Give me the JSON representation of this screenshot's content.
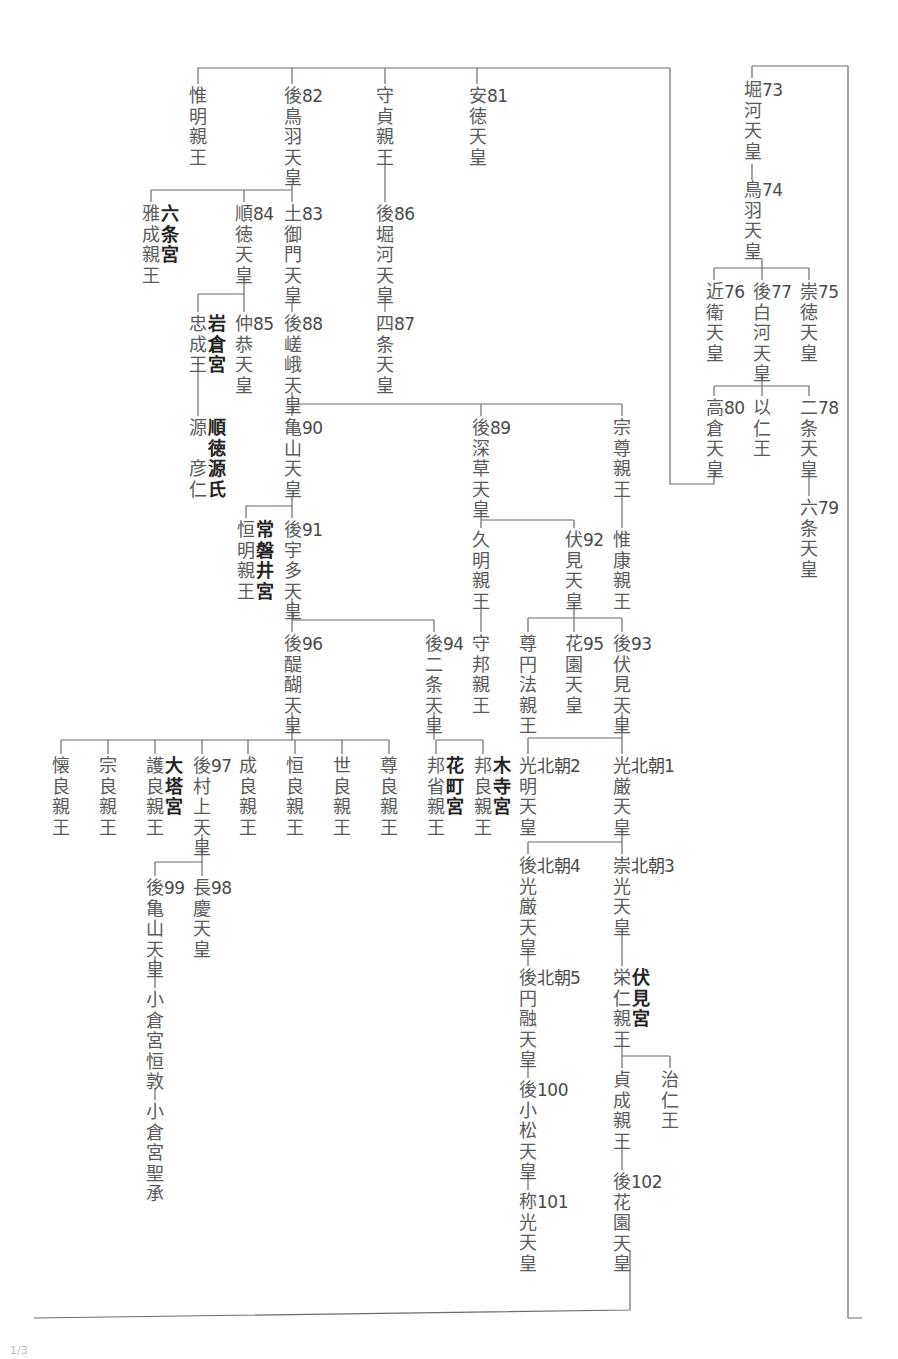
{
  "page_number": "1/3",
  "nodes": [
    {
      "id": "horikawa",
      "name": "堀河天皇",
      "num": "73",
      "x": 743,
      "y": 80
    },
    {
      "id": "toba",
      "name": "鳥羽天皇",
      "num": "74",
      "x": 743,
      "y": 180
    },
    {
      "id": "konoe",
      "name": "近衛天皇",
      "num": "76",
      "x": 705,
      "y": 282
    },
    {
      "id": "goshirakawa",
      "name": "後白河天皇",
      "num": "77",
      "x": 752,
      "y": 282
    },
    {
      "id": "sutoku",
      "name": "崇徳天皇",
      "num": "75",
      "x": 799,
      "y": 282
    },
    {
      "id": "takakura",
      "name": "高倉天皇",
      "num": "80",
      "x": 705,
      "y": 398
    },
    {
      "id": "mochihito",
      "name": "以仁王",
      "num": "",
      "x": 752,
      "y": 398
    },
    {
      "id": "nijo",
      "name": "二条天皇",
      "num": "78",
      "x": 799,
      "y": 398
    },
    {
      "id": "rokujo",
      "name": "六条天皇",
      "num": "79",
      "x": 799,
      "y": 498
    },
    {
      "id": "koremei",
      "name": "惟明親王",
      "num": "",
      "x": 188,
      "y": 86
    },
    {
      "id": "gotoba",
      "name": "後鳥羽天皇",
      "num": "82",
      "x": 283,
      "y": 86
    },
    {
      "id": "morisada",
      "name": "守貞親王",
      "num": "",
      "x": 375,
      "y": 86
    },
    {
      "id": "antoku",
      "name": "安徳天皇",
      "num": "81",
      "x": 468,
      "y": 86
    },
    {
      "id": "gohorikawa",
      "name": "後堀河天皇",
      "num": "86",
      "x": 375,
      "y": 204
    },
    {
      "id": "shijo",
      "name": "四条天皇",
      "num": "87",
      "x": 375,
      "y": 314
    },
    {
      "id": "masanari",
      "name": "雅成親王",
      "num": "",
      "x": 141,
      "y": 204,
      "house": "六条宮"
    },
    {
      "id": "juntoku",
      "name": "順徳天皇",
      "num": "84",
      "x": 234,
      "y": 204
    },
    {
      "id": "tsuchimikado",
      "name": "土御門天皇",
      "num": "83",
      "x": 283,
      "y": 204
    },
    {
      "id": "tadanari",
      "name": "忠成王",
      "num": "",
      "x": 188,
      "y": 314,
      "house": "岩倉宮"
    },
    {
      "id": "chukyo",
      "name": "仲恭天皇",
      "num": "85",
      "x": 234,
      "y": 314
    },
    {
      "id": "gosaga",
      "name": "後嵯峨天皇",
      "num": "88",
      "x": 283,
      "y": 314
    },
    {
      "id": "minamoto",
      "name": "源彦仁",
      "num": "",
      "x": 188,
      "y": 418,
      "house": "順徳源氏",
      "special": true
    },
    {
      "id": "kameyama",
      "name": "亀山天皇",
      "num": "90",
      "x": 283,
      "y": 418
    },
    {
      "id": "gofukakusa",
      "name": "後深草天皇",
      "num": "89",
      "x": 471,
      "y": 418
    },
    {
      "id": "munetaka",
      "name": "宗尊親王",
      "num": "",
      "x": 612,
      "y": 418
    },
    {
      "id": "tsuneaki",
      "name": "恒明親王",
      "num": "",
      "x": 236,
      "y": 520,
      "house": "常磐井宮"
    },
    {
      "id": "gouda",
      "name": "後宇多天皇",
      "num": "91",
      "x": 283,
      "y": 520
    },
    {
      "id": "hisaaki",
      "name": "久明親王",
      "num": "",
      "x": 471,
      "y": 530
    },
    {
      "id": "fushimi",
      "name": "伏見天皇",
      "num": "92",
      "x": 564,
      "y": 530
    },
    {
      "id": "koreyasu",
      "name": "惟康親王",
      "num": "",
      "x": 612,
      "y": 530
    },
    {
      "id": "godaigo",
      "name": "後醍醐天皇",
      "num": "96",
      "x": 283,
      "y": 634
    },
    {
      "id": "gonijo",
      "name": "後二条天皇",
      "num": "94",
      "x": 424,
      "y": 634
    },
    {
      "id": "morikuni",
      "name": "守邦親王",
      "num": "",
      "x": 471,
      "y": 634
    },
    {
      "id": "sonen",
      "name": "尊円法親王",
      "num": "",
      "x": 518,
      "y": 634
    },
    {
      "id": "hanazono",
      "name": "花園天皇",
      "num": "95",
      "x": 564,
      "y": 634
    },
    {
      "id": "gofushimi",
      "name": "後伏見天皇",
      "num": "93",
      "x": 612,
      "y": 634
    },
    {
      "id": "kaneyoshi",
      "name": "懐良親王",
      "num": "",
      "x": 51,
      "y": 756
    },
    {
      "id": "muneyoshi",
      "name": "宗良親王",
      "num": "",
      "x": 98,
      "y": 756
    },
    {
      "id": "moriyoshi",
      "name": "護良親王",
      "num": "",
      "x": 145,
      "y": 756,
      "house": "大塔宮"
    },
    {
      "id": "gomurakami",
      "name": "後村上天皇",
      "num": "97",
      "x": 192,
      "y": 756
    },
    {
      "id": "nariyoshi",
      "name": "成良親王",
      "num": "",
      "x": 238,
      "y": 756
    },
    {
      "id": "tsuneyoshi",
      "name": "恒良親王",
      "num": "",
      "x": 285,
      "y": 756
    },
    {
      "id": "tokiyoshi",
      "name": "世良親王",
      "num": "",
      "x": 332,
      "y": 756
    },
    {
      "id": "takayoshi",
      "name": "尊良親王",
      "num": "",
      "x": 379,
      "y": 756
    },
    {
      "id": "kunimi",
      "name": "邦省親王",
      "num": "",
      "x": 426,
      "y": 756,
      "house": "花町宮"
    },
    {
      "id": "kuniyoshi",
      "name": "邦良親王",
      "num": "",
      "x": 473,
      "y": 756,
      "house": "木寺宮"
    },
    {
      "id": "komyo",
      "name": "光明天皇",
      "num": "北朝2",
      "x": 518,
      "y": 756
    },
    {
      "id": "kogon",
      "name": "光厳天皇",
      "num": "北朝1",
      "x": 612,
      "y": 756
    },
    {
      "id": "gokameyama",
      "name": "後亀山天皇",
      "num": "99",
      "x": 145,
      "y": 878
    },
    {
      "id": "chokei",
      "name": "長慶天皇",
      "num": "98",
      "x": 192,
      "y": 878
    },
    {
      "id": "ogura1",
      "name": "小倉宮恒敦",
      "num": "",
      "x": 145,
      "y": 990
    },
    {
      "id": "ogura2",
      "name": "小倉宮聖承",
      "num": "",
      "x": 145,
      "y": 1102
    },
    {
      "id": "gokogon",
      "name": "後光厳天皇",
      "num": "北朝4",
      "x": 518,
      "y": 856
    },
    {
      "id": "suko",
      "name": "崇光天皇",
      "num": "北朝3",
      "x": 612,
      "y": 856
    },
    {
      "id": "goenyu",
      "name": "後円融天皇",
      "num": "北朝5",
      "x": 518,
      "y": 968
    },
    {
      "id": "yoshihito",
      "name": "栄仁親王",
      "num": "",
      "x": 612,
      "y": 968,
      "house": "伏見宮"
    },
    {
      "id": "haruhito",
      "name": "治仁王",
      "num": "",
      "x": 660,
      "y": 1070
    },
    {
      "id": "sadafusa",
      "name": "貞成親王",
      "num": "",
      "x": 612,
      "y": 1070
    },
    {
      "id": "gokomatsu",
      "name": "後小松天皇",
      "num": "100",
      "x": 518,
      "y": 1080
    },
    {
      "id": "gohanazono",
      "name": "後花園天皇",
      "num": "102",
      "x": 612,
      "y": 1172
    },
    {
      "id": "shoko",
      "name": "称光天皇",
      "num": "101",
      "x": 518,
      "y": 1192
    }
  ]
}
